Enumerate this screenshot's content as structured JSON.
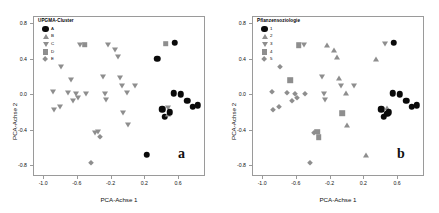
{
  "figure": {
    "axis_x_title": "PCA-Achse 1",
    "axis_y_title": "PCA-Achse 2",
    "x_ticks": [
      "-1.0",
      "-0.6",
      "-0.2",
      "0.2",
      "0.6"
    ],
    "y_ticks": [
      "0.8",
      "0.4",
      "0.0",
      "-0.4",
      "-0.8"
    ],
    "colors": {
      "point_filled": "#0a0a0a",
      "point_open": "#8e8e8e",
      "frame": "#9a9a9a",
      "background": "#ffffff"
    }
  },
  "panel_a": {
    "letter": "a",
    "legend_title": "UPGMA-Cluster",
    "legend": [
      {
        "label": "A",
        "symbol": "filled-circle"
      },
      {
        "label": "B",
        "symbol": "triangle-up"
      },
      {
        "label": "C",
        "symbol": "triangle-down"
      },
      {
        "label": "D",
        "symbol": "square"
      },
      {
        "label": "E",
        "symbol": "diamond"
      }
    ]
  },
  "panel_b": {
    "letter": "b",
    "legend_title": "Pflanzensoziologie",
    "legend": [
      {
        "label": "1",
        "symbol": "filled-circle"
      },
      {
        "label": "2",
        "symbol": "triangle-up"
      },
      {
        "label": "3",
        "symbol": "triangle-down"
      },
      {
        "label": "4",
        "symbol": "square"
      },
      {
        "label": "5",
        "symbol": "diamond"
      }
    ]
  },
  "chart_data": {
    "type": "scatter",
    "title": "",
    "xlabel": "PCA-Achse 1",
    "ylabel": "PCA-Achse 2",
    "xlim": [
      -1.12,
      0.92
    ],
    "ylim": [
      -0.92,
      0.88
    ],
    "xticks": [
      -1.0,
      -0.6,
      -0.2,
      0.2,
      0.6
    ],
    "yticks": [
      0.8,
      0.4,
      0.0,
      -0.4,
      -0.8
    ],
    "grid": false,
    "legend_position": "top-left",
    "panels": [
      {
        "id": "a",
        "legend_title": "UPGMA-Cluster",
        "groups": [
          "A",
          "B",
          "C",
          "D",
          "E"
        ],
        "symbols": {
          "A": "filled-circle",
          "B": "triangle-up",
          "C": "triangle-down",
          "D": "square",
          "E": "diamond"
        }
      },
      {
        "id": "b",
        "legend_title": "Pflanzensoziologie",
        "groups": [
          "1",
          "2",
          "3",
          "4",
          "5"
        ],
        "symbols": {
          "1": "filled-circle",
          "2": "triangle-up",
          "3": "triangle-down",
          "4": "square",
          "5": "diamond"
        }
      }
    ],
    "points": [
      {
        "x": -0.9,
        "y": 0.04,
        "a": "C",
        "b": "5"
      },
      {
        "x": -0.88,
        "y": -0.17,
        "a": "C",
        "b": "5"
      },
      {
        "x": -0.81,
        "y": -0.13,
        "a": "C",
        "b": "5"
      },
      {
        "x": -0.8,
        "y": 0.32,
        "a": "C",
        "b": "5"
      },
      {
        "x": -0.72,
        "y": 0.02,
        "a": "C",
        "b": "5"
      },
      {
        "x": -0.68,
        "y": 0.17,
        "a": "C",
        "b": "4"
      },
      {
        "x": -0.66,
        "y": -0.07,
        "a": "C",
        "b": "5"
      },
      {
        "x": -0.62,
        "y": 0.01,
        "a": "C",
        "b": "5"
      },
      {
        "x": -0.6,
        "y": -0.03,
        "a": "C",
        "b": "5"
      },
      {
        "x": -0.58,
        "y": 0.56,
        "a": "C",
        "b": "4"
      },
      {
        "x": -0.52,
        "y": 0.57,
        "a": "D",
        "b": "3"
      },
      {
        "x": -0.5,
        "y": 0.01,
        "a": "C",
        "b": "5"
      },
      {
        "x": -0.44,
        "y": -0.76,
        "a": "E",
        "b": "5"
      },
      {
        "x": -0.4,
        "y": -0.42,
        "a": "C",
        "b": "5"
      },
      {
        "x": -0.36,
        "y": -0.41,
        "a": "C",
        "b": "4"
      },
      {
        "x": -0.34,
        "y": -0.47,
        "a": "E",
        "b": "4"
      },
      {
        "x": -0.3,
        "y": 0.2,
        "a": "C",
        "b": "3"
      },
      {
        "x": -0.28,
        "y": 0.01,
        "a": "C",
        "b": "3"
      },
      {
        "x": -0.27,
        "y": -0.05,
        "a": "C",
        "b": "3"
      },
      {
        "x": -0.24,
        "y": 0.56,
        "a": "C",
        "b": "2"
      },
      {
        "x": -0.16,
        "y": 0.51,
        "a": "C",
        "b": "2"
      },
      {
        "x": -0.12,
        "y": 0.43,
        "a": "C",
        "b": "2"
      },
      {
        "x": -0.1,
        "y": 0.19,
        "a": "C",
        "b": "2"
      },
      {
        "x": -0.08,
        "y": 0.1,
        "a": "C",
        "b": "3"
      },
      {
        "x": -0.06,
        "y": -0.2,
        "a": "C",
        "b": "4"
      },
      {
        "x": -0.02,
        "y": 0.03,
        "a": "C",
        "b": "2"
      },
      {
        "x": 0.0,
        "y": -0.34,
        "a": "C",
        "b": "2"
      },
      {
        "x": 0.08,
        "y": 0.1,
        "a": "C",
        "b": "3"
      },
      {
        "x": 0.22,
        "y": -0.67,
        "a": "A",
        "b": "2"
      },
      {
        "x": 0.34,
        "y": 0.41,
        "a": "A",
        "b": "2"
      },
      {
        "x": 0.44,
        "y": 0.58,
        "a": "D",
        "b": "3"
      },
      {
        "x": 0.4,
        "y": -0.16,
        "a": "A",
        "b": "1"
      },
      {
        "x": 0.43,
        "y": -0.24,
        "a": "A",
        "b": "1"
      },
      {
        "x": 0.47,
        "y": -0.14,
        "a": "C",
        "b": "2"
      },
      {
        "x": 0.47,
        "y": -0.21,
        "a": "B",
        "b": "1"
      },
      {
        "x": 0.49,
        "y": -0.19,
        "a": "A",
        "b": "1"
      },
      {
        "x": 0.55,
        "y": 0.59,
        "a": "A",
        "b": "1"
      },
      {
        "x": 0.54,
        "y": 0.02,
        "a": "A",
        "b": "1"
      },
      {
        "x": 0.62,
        "y": 0.01,
        "a": "A",
        "b": "1"
      },
      {
        "x": 0.7,
        "y": -0.06,
        "a": "A",
        "b": "1"
      },
      {
        "x": 0.76,
        "y": -0.13,
        "a": "A",
        "b": "1"
      },
      {
        "x": 0.82,
        "y": -0.11,
        "a": "A",
        "b": "1"
      }
    ]
  }
}
